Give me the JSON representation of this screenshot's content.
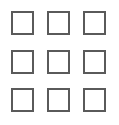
{
  "grid": {
    "rows": 3,
    "cols": 3,
    "border_color": "#5a5a5a",
    "cells": [
      {
        "row": 0,
        "col": 0,
        "x": 11,
        "y": 11
      },
      {
        "row": 0,
        "col": 1,
        "x": 47,
        "y": 11
      },
      {
        "row": 0,
        "col": 2,
        "x": 83,
        "y": 11
      },
      {
        "row": 1,
        "col": 0,
        "x": 11,
        "y": 50
      },
      {
        "row": 1,
        "col": 1,
        "x": 47,
        "y": 50
      },
      {
        "row": 1,
        "col": 2,
        "x": 83,
        "y": 50
      },
      {
        "row": 2,
        "col": 0,
        "x": 11,
        "y": 88
      },
      {
        "row": 2,
        "col": 1,
        "x": 47,
        "y": 88
      },
      {
        "row": 2,
        "col": 2,
        "x": 83,
        "y": 88
      }
    ]
  }
}
